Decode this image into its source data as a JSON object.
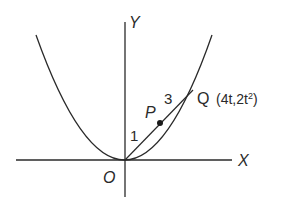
{
  "diagram": {
    "type": "parabola-chord-section",
    "axes": {
      "x_label": "X",
      "y_label": "Y",
      "origin_label": "O"
    },
    "curve": {
      "name": "parabola",
      "description": "Upward-opening parabola with vertex at origin O"
    },
    "points": {
      "P": {
        "label": "P",
        "description": "Point on chord OQ dividing it in ratio 1:3"
      },
      "Q": {
        "label": "Q",
        "coordinates_label": "(4t,2t",
        "coordinates_exponent": "2",
        "coordinates_close": ")"
      }
    },
    "ratio_labels": {
      "OP": "1",
      "PQ": "3"
    },
    "colors": {
      "ink": "#2a2a2a",
      "background": "#ffffff"
    }
  }
}
